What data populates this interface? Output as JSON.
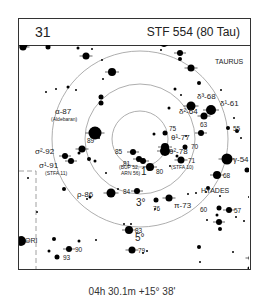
{
  "chart_number": "31",
  "title": "STF 554 (80 Tau)",
  "footer": "04h 30.1m  +15° 38'",
  "constellation_labels": [
    {
      "text": "TAURUS",
      "x": 196,
      "y": 19
    },
    {
      "text": "HYADES",
      "x": 182,
      "y": 148
    },
    {
      "text": "ORI",
      "x": 6,
      "y": 212
    }
  ],
  "circles": [
    {
      "label": "1°",
      "r": 28
    },
    {
      "label": "3°",
      "r": 55
    },
    {
      "label": "5°",
      "r": 88
    }
  ],
  "circle_label_pos": [
    {
      "x": 122,
      "y": 154
    },
    {
      "x": 117,
      "y": 185
    },
    {
      "x": 116,
      "y": 220
    }
  ],
  "center": {
    "x": 121,
    "y": 118
  },
  "stars": [
    {
      "x": 145,
      "y": 21,
      "s": 5,
      "label": "ε-74",
      "lx": 150,
      "ly": 16
    },
    {
      "x": 171,
      "y": 22,
      "s": 1.5
    },
    {
      "x": 172,
      "y": 47,
      "s": 3.5
    },
    {
      "x": 161,
      "y": 32,
      "s": 3
    },
    {
      "x": 161,
      "y": 38,
      "s": 2
    },
    {
      "x": 180,
      "y": 62,
      "s": 2
    },
    {
      "x": 198,
      "y": 18,
      "s": 1
    },
    {
      "x": 235,
      "y": 8,
      "s": 1
    },
    {
      "x": 210,
      "y": 11,
      "s": 1
    },
    {
      "x": 142,
      "y": 29,
      "s": 1
    },
    {
      "x": 172,
      "y": 85,
      "s": 4.5,
      "label": "δ³-68",
      "lx": 178,
      "ly": 78
    },
    {
      "x": 185,
      "y": 95,
      "s": 3.5,
      "label": "δ²-64",
      "lx": 160,
      "ly": 93
    },
    {
      "x": 192,
      "y": 89,
      "s": 5,
      "label": "δ¹-61",
      "lx": 201,
      "ly": 85
    },
    {
      "x": 182,
      "y": 112,
      "s": 3,
      "label": "63",
      "lx": 181,
      "ly": 106
    },
    {
      "x": 156,
      "y": 68,
      "s": 1.5
    },
    {
      "x": 162,
      "y": 74,
      "s": 1
    },
    {
      "x": 150,
      "y": 87,
      "s": 1.5
    },
    {
      "x": 202,
      "y": 69,
      "s": 1
    },
    {
      "x": 215,
      "y": 97,
      "s": 1
    },
    {
      "x": 218,
      "y": 110,
      "s": 2
    },
    {
      "x": 245,
      "y": 2,
      "s": 1
    },
    {
      "x": 2,
      "y": 2,
      "s": 1
    },
    {
      "x": 10,
      "y": 10,
      "s": 1
    },
    {
      "x": 4,
      "y": 26,
      "s": 3.5
    },
    {
      "x": 6,
      "y": 24,
      "s": 2.5
    },
    {
      "x": 29,
      "y": 26,
      "s": 2.5
    },
    {
      "x": 59,
      "y": 27,
      "s": 1.5
    },
    {
      "x": 67,
      "y": 35,
      "s": 3.5
    },
    {
      "x": 73,
      "y": 28,
      "s": 1
    },
    {
      "x": 83,
      "y": 39,
      "s": 1
    },
    {
      "x": 93,
      "y": 51,
      "s": 4
    },
    {
      "x": 84,
      "y": 58,
      "s": 1
    },
    {
      "x": 27,
      "y": 71,
      "s": 1
    },
    {
      "x": 37,
      "y": 68,
      "s": 1
    },
    {
      "x": 49,
      "y": 66,
      "s": 1.5
    },
    {
      "x": 57,
      "y": 69,
      "s": 1
    },
    {
      "x": 82,
      "y": 76,
      "s": 2.5
    },
    {
      "x": 82,
      "y": 82,
      "s": 2.5
    },
    {
      "x": 76,
      "y": 112,
      "s": 6.5,
      "label": "α-87",
      "lx": 36,
      "ly": 93
    },
    {
      "x": 63,
      "y": 128,
      "s": 3.5,
      "label": "89",
      "lx": 68,
      "ly": 122
    },
    {
      "x": 46,
      "y": 135,
      "s": 3,
      "label": "σ²-92",
      "lx": 16,
      "ly": 133
    },
    {
      "x": 52,
      "y": 140,
      "s": 3,
      "label": "σ¹-91",
      "lx": 20,
      "ly": 147
    },
    {
      "x": 60,
      "y": 132,
      "s": 1.5
    },
    {
      "x": 70,
      "y": 138,
      "s": 2
    },
    {
      "x": 76,
      "y": 140,
      "s": 1.5
    },
    {
      "x": 80,
      "y": 117,
      "s": 1
    },
    {
      "x": 45,
      "y": 168,
      "s": 2
    },
    {
      "x": 9,
      "y": 157,
      "s": 1
    },
    {
      "x": 71,
      "y": 176,
      "s": 1.5
    },
    {
      "x": 68,
      "y": 178,
      "s": 1
    },
    {
      "x": 92,
      "y": 172,
      "s": 4.5,
      "label": "ρ-86",
      "lx": 58,
      "ly": 176
    },
    {
      "x": 87,
      "y": 152,
      "s": 1
    },
    {
      "x": 99,
      "y": 168,
      "s": 1
    },
    {
      "x": 114,
      "y": 131,
      "s": 3,
      "label": "85",
      "lx": 96,
      "ly": 133
    },
    {
      "x": 120,
      "y": 138,
      "s": 3,
      "label": "81",
      "lx": 104,
      "ly": 145
    },
    {
      "x": 124,
      "y": 140,
      "s": 3
    },
    {
      "x": 131,
      "y": 146,
      "s": 4,
      "label": "80",
      "lx": 137,
      "ly": 153
    },
    {
      "x": 135,
      "y": 113,
      "s": 1.5
    },
    {
      "x": 146,
      "y": 126,
      "s": 4,
      "label": "θ¹-77",
      "lx": 152,
      "ly": 119
    },
    {
      "x": 146,
      "y": 130,
      "s": 5,
      "label": "θ²-78",
      "lx": 150,
      "ly": 133
    },
    {
      "x": 146,
      "y": 112,
      "s": 2.5,
      "label": "75",
      "lx": 150,
      "ly": 110
    },
    {
      "x": 166,
      "y": 126,
      "s": 2.5,
      "label": "70",
      "lx": 172,
      "ly": 128
    },
    {
      "x": 162,
      "y": 139,
      "s": 3.5,
      "label": "71",
      "lx": 169,
      "ly": 142
    },
    {
      "x": 158,
      "y": 135,
      "s": 1.5
    },
    {
      "x": 151,
      "y": 145,
      "s": 1
    },
    {
      "x": 167,
      "y": 115,
      "s": 1
    },
    {
      "x": 118,
      "y": 170,
      "s": 3,
      "label": "84",
      "lx": 104,
      "ly": 173
    },
    {
      "x": 137,
      "y": 179,
      "s": 2.5,
      "label": "76",
      "lx": 134,
      "ly": 190
    },
    {
      "x": 150,
      "y": 177,
      "s": 3.5,
      "label": "π-73",
      "lx": 155,
      "ly": 187
    },
    {
      "x": 169,
      "y": 173,
      "s": 1
    },
    {
      "x": 136,
      "y": 188,
      "s": 1
    },
    {
      "x": 208,
      "y": 138,
      "s": 5.5,
      "label": "γ-54",
      "lx": 214,
      "ly": 141
    },
    {
      "x": 198,
      "y": 154,
      "s": 4,
      "label": "68",
      "lx": 204,
      "ly": 157
    },
    {
      "x": 209,
      "y": 107,
      "s": 2,
      "label": "55",
      "lx": 214,
      "ly": 110
    },
    {
      "x": 222,
      "y": 117,
      "s": 1
    },
    {
      "x": 228,
      "y": 149,
      "s": 2.5,
      "label": "48",
      "lx": 234,
      "ly": 152
    },
    {
      "x": 189,
      "y": 167,
      "s": 2
    },
    {
      "x": 187,
      "y": 171,
      "s": 1
    },
    {
      "x": 177,
      "y": 172,
      "s": 1
    },
    {
      "x": 201,
      "y": 175,
      "s": 1
    },
    {
      "x": 230,
      "y": 176,
      "s": 1
    },
    {
      "x": 198,
      "y": 194,
      "s": 1.5
    },
    {
      "x": 200,
      "y": 201,
      "s": 3
    },
    {
      "x": 210,
      "y": 189,
      "s": 3,
      "label": "57",
      "lx": 215,
      "ly": 192
    },
    {
      "x": 200,
      "y": 187,
      "s": 2.5,
      "label": "60",
      "lx": 181,
      "ly": 191
    },
    {
      "x": 217,
      "y": 196,
      "s": 1
    },
    {
      "x": 225,
      "y": 200,
      "s": 1
    },
    {
      "x": 188,
      "y": 199,
      "s": 1
    },
    {
      "x": 110,
      "y": 209,
      "s": 4,
      "label": "83",
      "lx": 116,
      "ly": 212
    },
    {
      "x": 105,
      "y": 203,
      "s": 1
    },
    {
      "x": 112,
      "y": 203,
      "s": 1
    },
    {
      "x": 201,
      "y": 208,
      "s": 2
    },
    {
      "x": 113,
      "y": 229,
      "s": 3.5,
      "label": "79",
      "lx": 119,
      "ly": 232
    },
    {
      "x": 124,
      "y": 232,
      "s": 1
    },
    {
      "x": 128,
      "y": 230,
      "s": 1
    },
    {
      "x": 180,
      "y": 226,
      "s": 2
    },
    {
      "x": 181,
      "y": 241,
      "s": 1
    },
    {
      "x": 196,
      "y": 262,
      "s": 1
    },
    {
      "x": 214,
      "y": 231,
      "s": 1
    },
    {
      "x": 229,
      "y": 252,
      "s": 1.5
    },
    {
      "x": 230,
      "y": 247,
      "s": 1.5
    },
    {
      "x": 154,
      "y": 256,
      "s": 3
    },
    {
      "x": 150,
      "y": 261,
      "s": 1
    },
    {
      "x": 104,
      "y": 257,
      "s": 1
    },
    {
      "x": 233,
      "y": 237,
      "s": 3.5
    },
    {
      "x": 77,
      "y": 219,
      "s": 1
    },
    {
      "x": 60,
      "y": 220,
      "s": 1.5
    },
    {
      "x": 35,
      "y": 218,
      "s": 2
    },
    {
      "x": 50,
      "y": 228,
      "s": 3,
      "label": "90",
      "lx": 56,
      "ly": 231
    },
    {
      "x": 38,
      "y": 236,
      "s": 2.5,
      "label": "93",
      "lx": 44,
      "ly": 239
    },
    {
      "x": 30,
      "y": 230,
      "s": 1.5
    },
    {
      "x": 2,
      "y": 220,
      "s": 5
    },
    {
      "x": 18,
      "y": 191,
      "s": 1
    }
  ],
  "sub_labels": [
    {
      "text": "(Aldebaran)",
      "x": 32,
      "y": 100
    },
    {
      "text": "(STFA 11)",
      "x": 26,
      "y": 154
    },
    {
      "text": "(BUP 52,",
      "x": 100,
      "y": 148
    },
    {
      "text": "ARN 56)",
      "x": 102,
      "y": 154
    },
    {
      "text": "(STFA 10)",
      "x": 152,
      "y": 148
    }
  ]
}
